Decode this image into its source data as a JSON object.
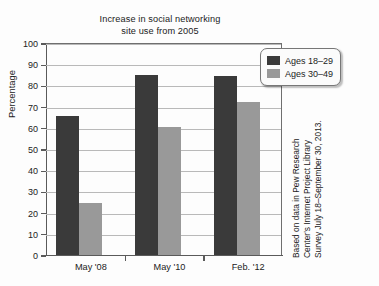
{
  "chart_data": {
    "type": "bar",
    "title": "Increase in social networking site use from 2005",
    "title_line1": "Increase in social networking",
    "title_line2": "site use from 2005",
    "xlabel": "",
    "ylabel": "Percentage",
    "ylim": [
      0,
      100
    ],
    "ytick_step": 10,
    "grid": true,
    "legend_position": "top-right",
    "categories": [
      "May '08",
      "May '10",
      "Feb. '12"
    ],
    "yticks": [
      "100",
      "90",
      "80",
      "70",
      "60",
      "50",
      "40",
      "30",
      "20",
      "10",
      "0"
    ],
    "ytick_values": [
      100,
      90,
      80,
      70,
      60,
      50,
      40,
      30,
      20,
      10,
      0
    ],
    "series": [
      {
        "name": "Ages 18–29",
        "color": "#3a3a3a",
        "values": [
          65.5,
          85,
          84.5
        ]
      },
      {
        "name": "Ages 30–49",
        "color": "#999999",
        "values": [
          24.5,
          60.5,
          72
        ]
      }
    ],
    "annotations": [
      "Based on data in Pew Research",
      "Center's Internet Project Library",
      "Survey July 18–September 30, 2013."
    ]
  },
  "legend": {
    "items": [
      {
        "label": "Ages 18–29"
      },
      {
        "label": "Ages 30–49"
      }
    ]
  },
  "source_note": {
    "line1": "Based on data in Pew Research",
    "line2": "Center's Internet Project Library",
    "line3": "Survey July 18–September 30, 2013."
  }
}
